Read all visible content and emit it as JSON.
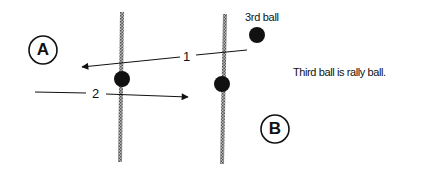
{
  "diagram": {
    "players": [
      {
        "id": "A",
        "label": "A",
        "cx": 43,
        "cy": 50,
        "r": 14
      },
      {
        "id": "B",
        "label": "B",
        "cx": 275,
        "cy": 129,
        "r": 14
      }
    ],
    "lines": [
      {
        "id": "line-1",
        "x1": 122,
        "y1": 12,
        "x2": 120,
        "y2": 162
      },
      {
        "id": "line-2",
        "x1": 225,
        "y1": 14,
        "x2": 222,
        "y2": 164
      }
    ],
    "balls": [
      {
        "id": "ball-1",
        "cx": 122,
        "cy": 79,
        "r": 8
      },
      {
        "id": "ball-2",
        "cx": 222,
        "cy": 84,
        "r": 8
      },
      {
        "id": "ball-3",
        "cx": 257,
        "cy": 35,
        "r": 8
      }
    ],
    "paths": [
      {
        "id": "path-1",
        "label": "1",
        "from": [
          247,
          50
        ],
        "to": [
          82,
          67
        ],
        "label_x": 184,
        "label_y": 52
      },
      {
        "id": "path-2",
        "label": "2",
        "from": [
          35,
          92
        ],
        "to": [
          188,
          97
        ],
        "label_x": 92,
        "label_y": 87
      }
    ],
    "third_ball_label": "3rd ball",
    "note": "Third ball is rally ball."
  }
}
